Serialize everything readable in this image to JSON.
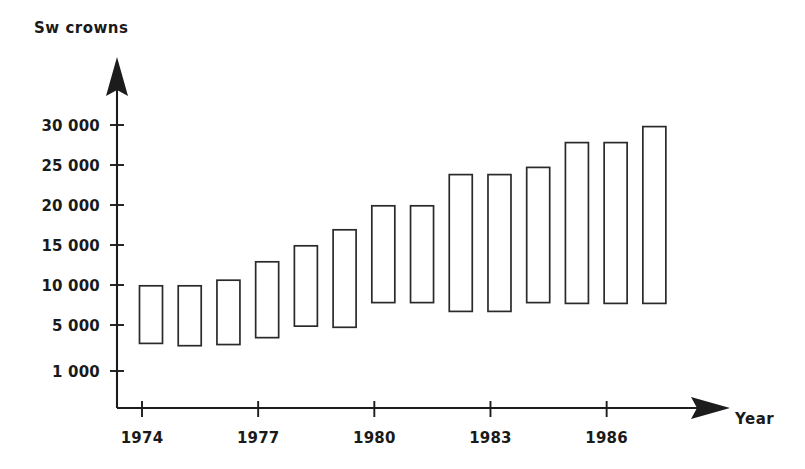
{
  "chart_data": {
    "type": "bar",
    "bar_style": "floating-range",
    "title": "",
    "ylabel": "Sw crowns",
    "xlabel": "Year",
    "grid": false,
    "legend": null,
    "categories": [
      "1974",
      "1975",
      "1976",
      "1977",
      "1978",
      "1979",
      "1980",
      "1981",
      "1982",
      "1983",
      "1984",
      "1985",
      "1986",
      "1987"
    ],
    "y_tick_labels": [
      "30 000",
      "25 000",
      "20 000",
      "15 000",
      "10 000",
      "5 000",
      "1 000"
    ],
    "y_tick_values": [
      30000,
      25000,
      20000,
      15000,
      10000,
      5000,
      1000
    ],
    "x_tick_labels": [
      "1974",
      "1977",
      "1980",
      "1983",
      "1986"
    ],
    "x_tick_values": [
      1974,
      1977,
      1980,
      1983,
      1986
    ],
    "ylim": [
      1000,
      31500
    ],
    "xlim": [
      1973.4,
      1987.8
    ],
    "series": [
      {
        "name": "low",
        "values": [
          3400,
          3200,
          3300,
          3900,
          4900,
          4800,
          7800,
          7800,
          6700,
          6700,
          7800,
          7700,
          7700,
          7700
        ]
      },
      {
        "name": "high",
        "values": [
          9900,
          9900,
          10600,
          12900,
          14900,
          16900,
          19900,
          19900,
          23800,
          23800,
          24700,
          27800,
          27800,
          29800
        ]
      }
    ],
    "bars": [
      {
        "year": "1974",
        "low": 3400,
        "high": 9900
      },
      {
        "year": "1975",
        "low": 3200,
        "high": 9900
      },
      {
        "year": "1976",
        "low": 3300,
        "high": 10600
      },
      {
        "year": "1977",
        "low": 3900,
        "high": 12900
      },
      {
        "year": "1978",
        "low": 4900,
        "high": 14900
      },
      {
        "year": "1979",
        "low": 4800,
        "high": 16900
      },
      {
        "year": "1980",
        "low": 7800,
        "high": 19900
      },
      {
        "year": "1981",
        "low": 7800,
        "high": 19900
      },
      {
        "year": "1982",
        "low": 6700,
        "high": 23800
      },
      {
        "year": "1983",
        "low": 6700,
        "high": 23800
      },
      {
        "year": "1984",
        "low": 7800,
        "high": 24700
      },
      {
        "year": "1985",
        "low": 7700,
        "high": 27800
      },
      {
        "year": "1986",
        "low": 7700,
        "high": 27800
      },
      {
        "year": "1987",
        "low": 7700,
        "high": 29800
      }
    ],
    "colors": {
      "bar_fill": "#ffffff",
      "bar_stroke": "#2a2a2a",
      "axis": "#1c1c1c",
      "text": "#1a1a1a",
      "background": "#ffffff"
    }
  }
}
